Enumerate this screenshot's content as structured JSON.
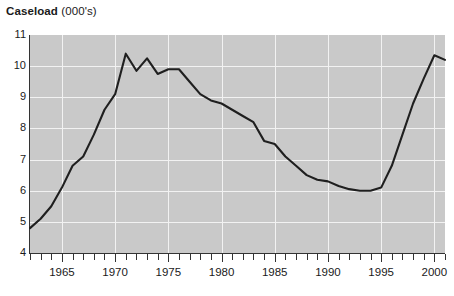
{
  "title": {
    "bold": "Caseload",
    "unit": "(000's)"
  },
  "axes": {
    "y_ticks": [
      11,
      10,
      9,
      8,
      7,
      6,
      5,
      4
    ],
    "x_labels": [
      1965,
      1970,
      1975,
      1980,
      1985,
      1990,
      1995,
      2000
    ],
    "x_tick_years_start": 1962,
    "x_tick_years_end": 2001
  },
  "colors": {
    "plot_background": "#c9c9c9",
    "gridline": "#f2f2f2",
    "series_line": "#1f1f1f",
    "axis": "#333333",
    "page_background": "#ffffff"
  },
  "chart_data": {
    "type": "line",
    "title": "Caseload (000's)",
    "xlabel": "",
    "ylabel": "Caseload (000's)",
    "xlim": [
      1962,
      2001
    ],
    "ylim": [
      4,
      11
    ],
    "grid": true,
    "legend": "none",
    "x": [
      1962,
      1963,
      1964,
      1965,
      1966,
      1967,
      1968,
      1969,
      1970,
      1971,
      1972,
      1973,
      1974,
      1975,
      1976,
      1977,
      1978,
      1979,
      1980,
      1981,
      1982,
      1983,
      1984,
      1985,
      1986,
      1987,
      1988,
      1989,
      1990,
      1991,
      1992,
      1993,
      1994,
      1995,
      1996,
      1997,
      1998,
      1999,
      2000,
      2001
    ],
    "values": [
      4.8,
      5.1,
      5.5,
      6.1,
      6.8,
      7.1,
      7.8,
      8.6,
      9.1,
      10.4,
      9.85,
      10.25,
      9.75,
      9.9,
      9.9,
      9.5,
      9.1,
      8.9,
      8.8,
      8.6,
      8.4,
      8.2,
      7.6,
      7.5,
      7.1,
      6.8,
      6.5,
      6.35,
      6.3,
      6.15,
      6.05,
      6.0,
      6.0,
      6.1,
      6.8,
      7.8,
      8.8,
      9.6,
      10.35,
      10.2
    ],
    "series": [
      {
        "name": "Caseload",
        "values": [
          4.8,
          5.1,
          5.5,
          6.1,
          6.8,
          7.1,
          7.8,
          8.6,
          9.1,
          10.4,
          9.85,
          10.25,
          9.75,
          9.9,
          9.9,
          9.5,
          9.1,
          8.9,
          8.8,
          8.6,
          8.4,
          8.2,
          7.6,
          7.5,
          7.1,
          6.8,
          6.5,
          6.35,
          6.3,
          6.15,
          6.05,
          6.0,
          6.0,
          6.1,
          6.8,
          7.8,
          8.8,
          9.6,
          10.35,
          10.2
        ]
      }
    ]
  }
}
